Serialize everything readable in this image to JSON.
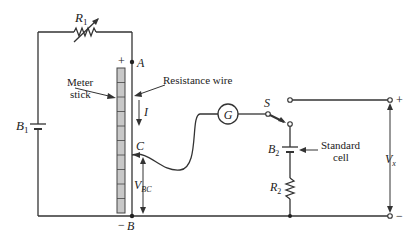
{
  "diagram": {
    "type": "circuit-schematic",
    "labels": {
      "r1": "R",
      "r1_sub": "1",
      "b1": "B",
      "b1_sub": "1",
      "meter_stick_line1": "Meter",
      "meter_stick_line2": "stick",
      "resistance_wire": "Resistance wire",
      "node_a": "A",
      "node_b": "B",
      "node_c": "C",
      "plus_top": "+",
      "minus_bottom": "−",
      "current": "I",
      "vbc": "V",
      "vbc_sub": "BC",
      "galvanometer": "G",
      "switch": "S",
      "b2": "B",
      "b2_sub": "2",
      "standard_cell_line1": "Standard",
      "standard_cell_line2": "cell",
      "r2": "R",
      "r2_sub": "2",
      "vx": "V",
      "vx_sub": "x",
      "terminal_plus": "+",
      "terminal_minus": "−"
    },
    "colors": {
      "wire": "#333333",
      "meter_fill": "#c8c8c8",
      "meter_stroke": "#444444",
      "background": "#ffffff"
    }
  }
}
